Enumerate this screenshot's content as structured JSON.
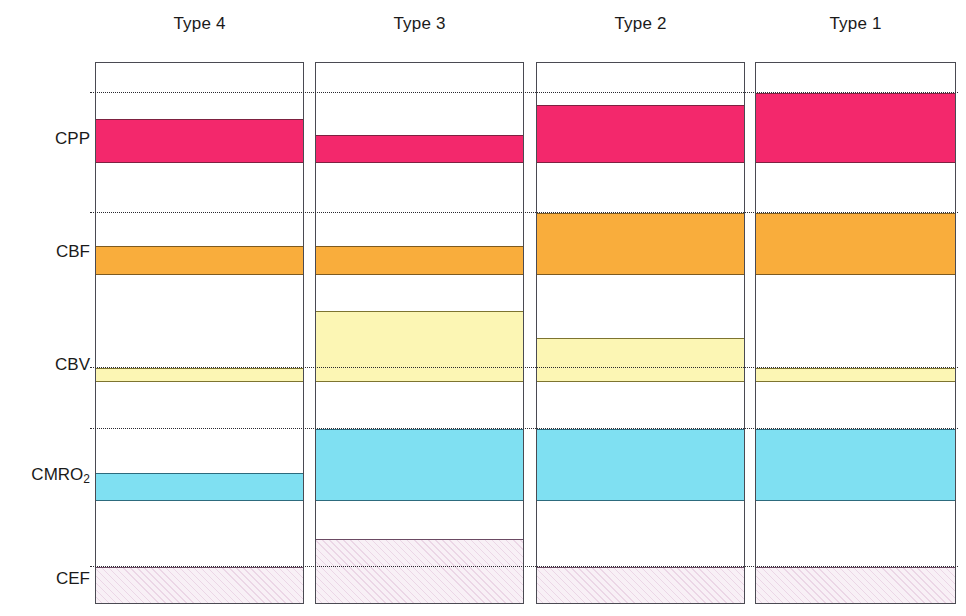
{
  "figure": {
    "width": 966,
    "height": 616,
    "background": "#ffffff"
  },
  "columns": [
    {
      "id": "type4",
      "label": "Type 4",
      "x": 95,
      "width": 209
    },
    {
      "id": "type3",
      "label": "Type 3",
      "x": 315,
      "width": 209
    },
    {
      "id": "type2",
      "label": "Type 2",
      "x": 536,
      "width": 209
    },
    {
      "id": "type1",
      "label": "Type 1",
      "x": 755,
      "width": 201
    }
  ],
  "rows": [
    {
      "id": "cpp",
      "label": "CPP",
      "label_sub": "",
      "label_y": 130,
      "color": "#f3286c"
    },
    {
      "id": "cbf",
      "label": "CBF",
      "label_sub": "",
      "label_y": 243,
      "color": "#f9ad3c"
    },
    {
      "id": "cbv",
      "label": "CBV",
      "label_sub": "",
      "label_y": 356,
      "color": "#fcf6b4"
    },
    {
      "id": "cmro2",
      "label": "CMRO",
      "label_sub": "2",
      "label_y": 466,
      "color": "#7fe0f2"
    },
    {
      "id": "cef",
      "label": "CEF",
      "label_sub": "",
      "label_y": 570,
      "color": "#f8f0f6"
    }
  ],
  "reference_lines": [
    {
      "id": "ref-cpp",
      "y": 92
    },
    {
      "id": "ref-cbf",
      "y": 212
    },
    {
      "id": "ref-cbv",
      "y": 367
    },
    {
      "id": "ref-cmro2",
      "y": 428
    },
    {
      "id": "ref-cef",
      "y": 566
    }
  ],
  "panel_geometry": {
    "top": 62,
    "bottom": 604,
    "height": 542
  },
  "chart_data": {
    "type": "bar",
    "title": "",
    "subtitle": "",
    "xlabel": "",
    "ylabel": "",
    "orientation": "horizontal-bands",
    "categories": [
      "Type 4",
      "Type 3",
      "Type 2",
      "Type 1"
    ],
    "parameters": [
      "CPP",
      "CBF",
      "CBV",
      "CMRO2",
      "CEF"
    ],
    "legend": [],
    "grid": "dotted reference lines only",
    "baseline_y": {
      "CPP": 92,
      "CBF": 212,
      "CBV": 367,
      "CMRO2": 428,
      "CEF": 566
    },
    "bands": [
      {
        "parameter": "CPP",
        "color": "#f3286c",
        "values": [
          {
            "category": "Type 4",
            "top": 118,
            "bottom": 162,
            "relative_to_baseline": "below"
          },
          {
            "category": "Type 3",
            "top": 134,
            "bottom": 162,
            "relative_to_baseline": "below"
          },
          {
            "category": "Type 2",
            "top": 104,
            "bottom": 162,
            "relative_to_baseline": "below"
          },
          {
            "category": "Type 1",
            "top": 92,
            "bottom": 162,
            "relative_to_baseline": "at"
          }
        ]
      },
      {
        "parameter": "CBF",
        "color": "#f9ad3c",
        "values": [
          {
            "category": "Type 4",
            "top": 245,
            "bottom": 274,
            "relative_to_baseline": "below"
          },
          {
            "category": "Type 3",
            "top": 245,
            "bottom": 274,
            "relative_to_baseline": "below"
          },
          {
            "category": "Type 2",
            "top": 212,
            "bottom": 274,
            "relative_to_baseline": "at"
          },
          {
            "category": "Type 1",
            "top": 212,
            "bottom": 274,
            "relative_to_baseline": "at"
          }
        ]
      },
      {
        "parameter": "CBV",
        "color": "#fcf6b4",
        "values": [
          {
            "category": "Type 4",
            "top": 367,
            "bottom": 381,
            "relative_to_baseline": "at"
          },
          {
            "category": "Type 3",
            "top": 310,
            "bottom": 381,
            "relative_to_baseline": "above"
          },
          {
            "category": "Type 2",
            "top": 337,
            "bottom": 381,
            "relative_to_baseline": "above"
          },
          {
            "category": "Type 1",
            "top": 367,
            "bottom": 381,
            "relative_to_baseline": "at"
          }
        ]
      },
      {
        "parameter": "CMRO2",
        "color": "#7fe0f2",
        "values": [
          {
            "category": "Type 4",
            "top": 472,
            "bottom": 500,
            "relative_to_baseline": "below"
          },
          {
            "category": "Type 3",
            "top": 428,
            "bottom": 500,
            "relative_to_baseline": "at"
          },
          {
            "category": "Type 2",
            "top": 428,
            "bottom": 500,
            "relative_to_baseline": "at"
          },
          {
            "category": "Type 1",
            "top": 428,
            "bottom": 500,
            "relative_to_baseline": "at"
          }
        ]
      },
      {
        "parameter": "CEF",
        "color": "#f8f0f6",
        "hatched": true,
        "values": [
          {
            "category": "Type 4",
            "top": 566,
            "bottom": 604,
            "relative_to_baseline": "at"
          },
          {
            "category": "Type 3",
            "top": 538,
            "bottom": 604,
            "relative_to_baseline": "above"
          },
          {
            "category": "Type 2",
            "top": 566,
            "bottom": 604,
            "relative_to_baseline": "at"
          },
          {
            "category": "Type 1",
            "top": 566,
            "bottom": 604,
            "relative_to_baseline": "at"
          }
        ]
      }
    ]
  }
}
